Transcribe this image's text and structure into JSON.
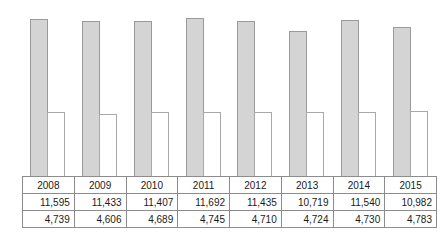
{
  "chart_data": {
    "type": "bar",
    "title": "",
    "subtitle": "",
    "xlabel": "",
    "ylabel": "",
    "grid": false,
    "legend": "none",
    "ylim": [
      0,
      12400
    ],
    "categories": [
      "2008",
      "2009",
      "2010",
      "2011",
      "2012",
      "2013",
      "2014",
      "2015"
    ],
    "series": [
      {
        "name": "series-1",
        "style": "gray-filled",
        "color": "#d4d4d4",
        "values": [
          11595,
          11433,
          11407,
          11692,
          11435,
          10719,
          11540,
          10982
        ],
        "labels": [
          "11,595",
          "11,433",
          "11,407",
          "11,692",
          "11,435",
          "10,719",
          "11,540",
          "10,982"
        ]
      },
      {
        "name": "series-2",
        "style": "white-outlined",
        "color": "#ffffff",
        "values": [
          4739,
          4606,
          4689,
          4745,
          4710,
          4724,
          4730,
          4783
        ],
        "labels": [
          "4,739",
          "4,606",
          "4,689",
          "4,745",
          "4,710",
          "4,724",
          "4,730",
          "4,783"
        ]
      }
    ]
  },
  "table": {
    "rows": [
      {
        "name": "year-row",
        "cells": [
          "2008",
          "2009",
          "2010",
          "2011",
          "2012",
          "2013",
          "2014",
          "2015"
        ]
      },
      {
        "name": "series-1-row",
        "cells": [
          "11,595",
          "11,433",
          "11,407",
          "11,692",
          "11,435",
          "10,719",
          "11,540",
          "10,982"
        ]
      },
      {
        "name": "series-2-row",
        "cells": [
          "4,739",
          "4,606",
          "4,689",
          "4,745",
          "4,710",
          "4,724",
          "4,730",
          "4,783"
        ]
      }
    ]
  },
  "style": {
    "primary_fill": "#d4d4d4",
    "primary_stroke": "#9a9a9a",
    "secondary_fill": "#ffffff",
    "secondary_stroke": "#a8a8a8",
    "table_border": "#8c8c8c",
    "text_color": "#1a1a1a",
    "background": "#ffffff"
  }
}
